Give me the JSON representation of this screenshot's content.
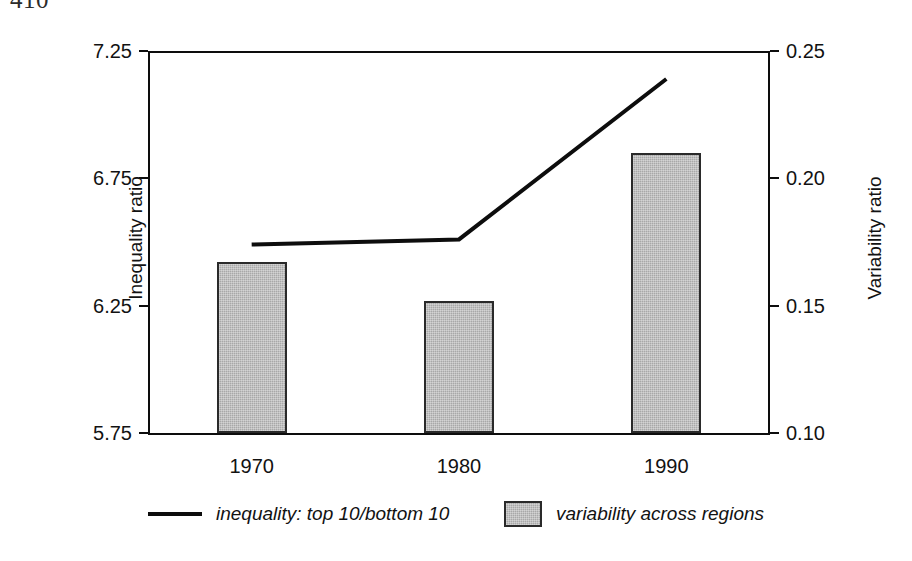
{
  "page": {
    "number": "410"
  },
  "chart_data": {
    "type": "bar",
    "title": "",
    "subtitle": "",
    "xlabel": "",
    "categories": [
      "1970",
      "1980",
      "1990"
    ],
    "grid": false,
    "legend_position": "bottom",
    "axes": {
      "left": {
        "label": "Inequality ratio",
        "ticks": [
          "5.75",
          "6.25",
          "6.75",
          "7.25"
        ],
        "tick_values": [
          5.75,
          6.25,
          6.75,
          7.25
        ],
        "ylim": [
          5.75,
          7.25
        ]
      },
      "right": {
        "label": "Variability ratio",
        "ticks": [
          "0.10",
          "0.15",
          "0.20",
          "0.25"
        ],
        "tick_values": [
          0.1,
          0.15,
          0.2,
          0.25
        ],
        "ylim": [
          0.1,
          0.25
        ]
      }
    },
    "series": [
      {
        "name": "inequality: top 10/bottom 10",
        "render": "line",
        "axis": "left",
        "color": "#0d0d0d",
        "values": [
          6.49,
          6.51,
          7.14
        ]
      },
      {
        "name": "variability across regions",
        "render": "bar",
        "axis": "right",
        "color": "#a8a8a8",
        "edge_color": "#2a2a2a",
        "values": [
          0.167,
          0.152,
          0.21
        ]
      }
    ]
  },
  "legend": {
    "entries": [
      {
        "label": "inequality: top 10/bottom 10",
        "swatch": "line"
      },
      {
        "label": "variability across regions",
        "swatch": "bar"
      }
    ]
  }
}
